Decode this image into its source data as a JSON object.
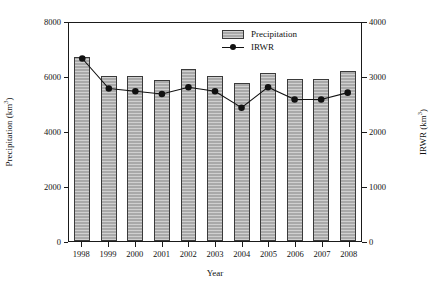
{
  "chart_data": {
    "type": "bar",
    "title": "",
    "subtitle": "",
    "xlabel": "Year",
    "ylabel": "Precipitation (km3)",
    "ylabel_right": "IRWR (km3)",
    "categories": [
      "1998",
      "1999",
      "2000",
      "2001",
      "2002",
      "2003",
      "2004",
      "2005",
      "2006",
      "2007",
      "2008"
    ],
    "series": [
      {
        "name": "Precipitation",
        "type": "bar",
        "axis": "left",
        "unit": "km3",
        "color": "#a9a9a9",
        "values": [
          6700,
          6000,
          6000,
          5850,
          6250,
          6000,
          5750,
          6100,
          5900,
          5900,
          6200
        ]
      },
      {
        "name": "IRWR",
        "type": "line",
        "axis": "right",
        "unit": "km3",
        "color": "#111111",
        "marker": "filled-circle",
        "values": [
          3350,
          2800,
          2750,
          2700,
          2825,
          2750,
          2450,
          2825,
          2600,
          2600,
          2725
        ]
      }
    ],
    "ylim": [
      0,
      8000
    ],
    "ylim_right": [
      0,
      4000
    ],
    "yticks": [
      0,
      2000,
      4000,
      6000,
      8000
    ],
    "yticks_right": [
      0,
      1000,
      2000,
      3000,
      4000
    ],
    "grid": false,
    "legend_position": "top-right"
  },
  "axes": {
    "left": {
      "title_text": "Precipitation (km",
      "title_sup": "3",
      "title_tail": ")",
      "ticks": [
        "8000",
        "6000",
        "4000",
        "2000",
        "0"
      ]
    },
    "right": {
      "title_text": "IRWR (km",
      "title_sup": "3",
      "title_tail": ")",
      "ticks": [
        "4000",
        "3000",
        "2000",
        "1000",
        "0"
      ]
    },
    "x": {
      "title": "Year",
      "ticks": [
        "1998",
        "1999",
        "2000",
        "2001",
        "2002",
        "2003",
        "2004",
        "2005",
        "2006",
        "2007",
        "2008"
      ]
    }
  },
  "legend": {
    "items": [
      {
        "label": "Precipitation",
        "kind": "swatch"
      },
      {
        "label": "IRWR",
        "kind": "line-marker"
      }
    ]
  }
}
